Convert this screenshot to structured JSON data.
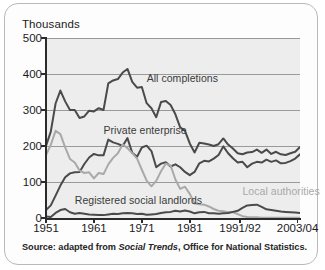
{
  "figure": {
    "units_label": "Thousands",
    "source_prefix": "Source: adapted from ",
    "source_italic": "Social Trends",
    "source_suffix": ", Office for National Statistics."
  },
  "chart_data": {
    "type": "line",
    "title": "",
    "subtitle": "",
    "xlabel": "",
    "ylabel": "Thousands",
    "ylim": [
      0,
      500
    ],
    "xlim": [
      1951,
      2004
    ],
    "grid": true,
    "legend_position": "inline-annotations",
    "yticks": [
      0,
      100,
      200,
      300,
      400,
      500
    ],
    "ytick_labels": [
      "0",
      "100",
      "200",
      "300",
      "400",
      "500"
    ],
    "xticks": [
      1951,
      1961,
      1971,
      1981,
      1991.5,
      2003.5
    ],
    "xtick_labels": [
      "1951",
      "1961",
      "1971",
      "1981",
      "1991/92",
      "2003/04"
    ],
    "colors": {
      "all_completions": "#4a4a4a",
      "private_enterprise": "#4a4a4a",
      "local_authorities": "#a9a9a9",
      "registered_social_landlords": "#4a4a4a",
      "plot_background": "#ededed",
      "gridline": "#9a9a9a",
      "axis": "#2b2b2b"
    },
    "annotations": [
      {
        "text": "All completions",
        "x": 1972,
        "y": 385,
        "color": "#3a3a3a"
      },
      {
        "text": "Private enterprise",
        "x": 1963,
        "y": 243,
        "color": "#3a3a3a"
      },
      {
        "text": "Local authorities",
        "x": 1992,
        "y": 72,
        "color": "#a9a9a9"
      },
      {
        "text": "Registered social landlords",
        "x": 1957,
        "y": 47,
        "color": "#3a3a3a"
      }
    ],
    "x": [
      1951,
      1952,
      1953,
      1954,
      1955,
      1956,
      1957,
      1958,
      1959,
      1960,
      1961,
      1962,
      1963,
      1964,
      1965,
      1966,
      1967,
      1968,
      1969,
      1970,
      1971,
      1972,
      1973,
      1974,
      1975,
      1976,
      1977,
      1978,
      1979,
      1980,
      1981,
      1982,
      1983,
      1984,
      1985,
      1986,
      1987,
      1988,
      1989,
      1990,
      1991,
      1992,
      1993,
      1994,
      1995,
      1996,
      1997,
      1998,
      1999,
      2000,
      2001,
      2002,
      2003,
      2004
    ],
    "series": [
      {
        "name": "All completions",
        "values": [
          200,
          240,
          318,
          354,
          324,
          300,
          300,
          278,
          282,
          298,
          296,
          305,
          300,
          374,
          382,
          386,
          404,
          414,
          378,
          362,
          364,
          319,
          305,
          280,
          322,
          325,
          314,
          288,
          252,
          242,
          207,
          182,
          209,
          207,
          204,
          200,
          205,
          221,
          204,
          193,
          180,
          177,
          182,
          183,
          190,
          181,
          190,
          178,
          184,
          177,
          175,
          180,
          184,
          197
        ]
      },
      {
        "name": "Private enterprise",
        "values": [
          22,
          35,
          62,
          90,
          113,
          124,
          127,
          128,
          150,
          168,
          178,
          174,
          174,
          218,
          210,
          206,
          200,
          222,
          181,
          170,
          196,
          201,
          186,
          141,
          151,
          155,
          143,
          149,
          141,
          128,
          119,
          128,
          152,
          159,
          157,
          165,
          175,
          199,
          180,
          166,
          154,
          156,
          141,
          151,
          156,
          154,
          162,
          156,
          160,
          152,
          153,
          158,
          165,
          177
        ]
      },
      {
        "name": "Local authorities",
        "values": [
          175,
          203,
          242,
          233,
          196,
          164,
          154,
          132,
          125,
          127,
          110,
          125,
          122,
          149,
          167,
          180,
          204,
          194,
          180,
          165,
          134,
          104,
          88,
          103,
          130,
          151,
          146,
          107,
          81,
          87,
          67,
          40,
          38,
          37,
          32,
          25,
          20,
          19,
          16,
          16,
          11,
          5,
          3,
          2,
          2,
          1,
          1,
          1,
          1,
          1,
          1,
          1,
          1,
          1
        ]
      },
      {
        "name": "Registered social landlords",
        "values": [
          4,
          3,
          14,
          22,
          25,
          16,
          12,
          14,
          12,
          10,
          9,
          8,
          8,
          10,
          12,
          11,
          13,
          14,
          13,
          11,
          12,
          9,
          10,
          11,
          14,
          16,
          17,
          20,
          18,
          21,
          18,
          13,
          16,
          17,
          13,
          13,
          12,
          13,
          14,
          17,
          20,
          28,
          35,
          36,
          37,
          31,
          24,
          22,
          20,
          18,
          17,
          16,
          15,
          14
        ]
      }
    ]
  }
}
